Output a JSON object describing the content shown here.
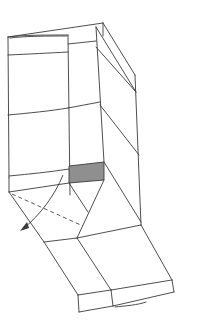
{
  "diagram": {
    "type": "folding-instruction-illustration",
    "colors": {
      "background": "#ffffff",
      "line": "#3a3a3a",
      "shaded_panel": "#8f8f8f"
    },
    "elements": [
      "box-body-top",
      "front-left-panel",
      "front-middle-panel",
      "right-side-panel",
      "shaded-square",
      "fold-arrow",
      "dashed-fold-line",
      "lower-flap-left",
      "lower-flap-right"
    ]
  }
}
